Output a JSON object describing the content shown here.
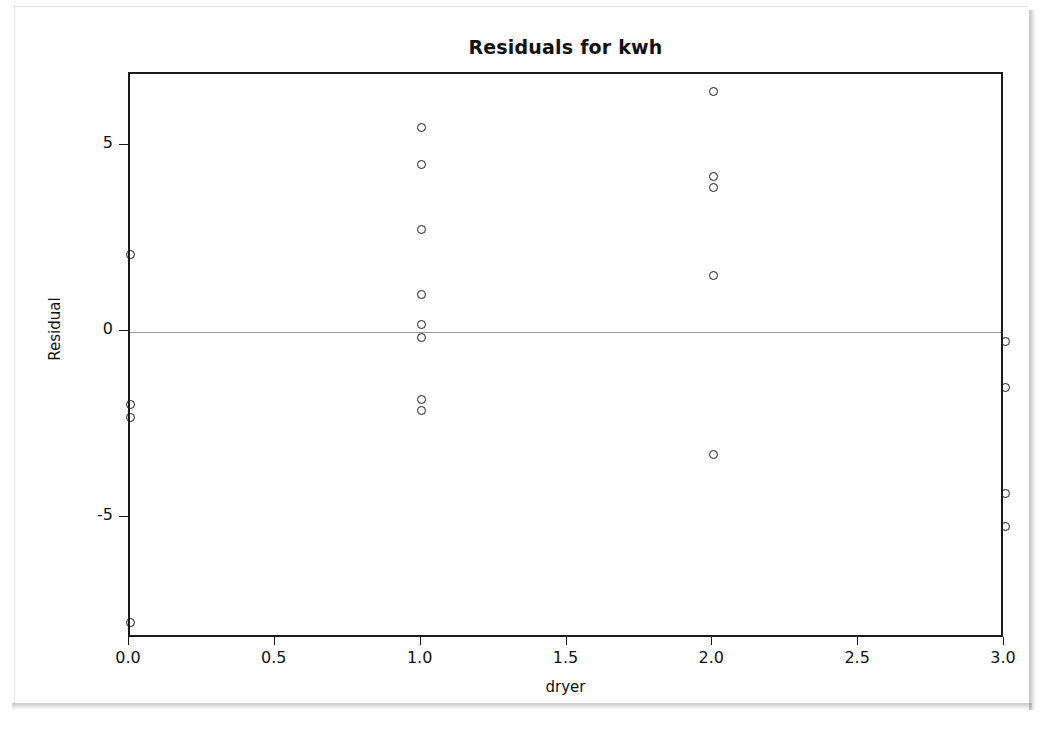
{
  "chart_data": {
    "type": "scatter",
    "title": "Residuals for kwh",
    "xlabel": "dryer",
    "ylabel": "Residual",
    "xlim": [
      0.0,
      3.0
    ],
    "ylim": [
      -8.26,
      6.93
    ],
    "grid": false,
    "legend": null,
    "zero_reference_line": 0,
    "xticks": [
      0.0,
      0.5,
      1.0,
      1.5,
      2.0,
      2.5,
      3.0
    ],
    "xticklabels": [
      "0.0",
      "0.5",
      "1.0",
      "1.5",
      "2.0",
      "2.5",
      "3.0"
    ],
    "yticks": [
      5,
      0,
      -5
    ],
    "yticklabels": [
      "5",
      "0",
      "-5"
    ],
    "marker": "open-circle",
    "marker_color": "#1a1a1a",
    "points": [
      {
        "x": 0.0,
        "y": 2.07
      },
      {
        "x": 0.0,
        "y": -1.96
      },
      {
        "x": 0.0,
        "y": -2.31
      },
      {
        "x": 0.0,
        "y": -7.82
      },
      {
        "x": 1.0,
        "y": 5.48
      },
      {
        "x": 1.0,
        "y": 4.49
      },
      {
        "x": 1.0,
        "y": 2.74
      },
      {
        "x": 1.0,
        "y": 0.99
      },
      {
        "x": 1.0,
        "y": 0.19
      },
      {
        "x": 1.0,
        "y": -0.16
      },
      {
        "x": 1.0,
        "y": -1.83
      },
      {
        "x": 1.0,
        "y": -2.12
      },
      {
        "x": 2.0,
        "y": 6.45
      },
      {
        "x": 2.0,
        "y": 4.17
      },
      {
        "x": 2.0,
        "y": 3.87
      },
      {
        "x": 2.0,
        "y": 1.51
      },
      {
        "x": 2.0,
        "y": -3.31
      },
      {
        "x": 3.0,
        "y": -0.27
      },
      {
        "x": 3.0,
        "y": -1.5
      },
      {
        "x": 3.0,
        "y": -4.35
      },
      {
        "x": 3.0,
        "y": -5.24
      }
    ]
  },
  "colors": {
    "axis": "#1a1a1a",
    "zero_line": "#9a9a9a",
    "text": "#111111",
    "background": "#ffffff"
  }
}
